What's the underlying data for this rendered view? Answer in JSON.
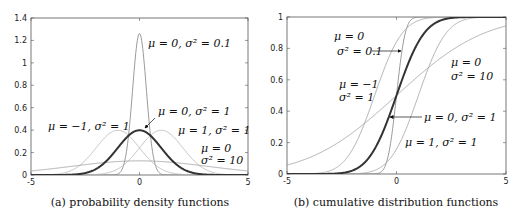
{
  "chart_data": [
    {
      "type": "line",
      "title": "(a) probability density functions",
      "xlabel": "",
      "ylabel": "",
      "xlim": [
        -5,
        5
      ],
      "ylim": [
        0,
        1.4
      ],
      "xticks": [
        -5,
        0,
        5
      ],
      "yticks": [
        0,
        0.2,
        0.4,
        0.6,
        0.8,
        1,
        1.2,
        1.4
      ],
      "grid": false,
      "function": "pdf",
      "series": [
        {
          "name": "μ = 0, σ² = 0.1",
          "mu": 0,
          "var": 0.1,
          "color": "#808080",
          "width": 0.8,
          "peak": 1.26
        },
        {
          "name": "μ = −1, σ² = 1",
          "mu": -1,
          "var": 1,
          "color": "#b4b4b4",
          "width": 0.8,
          "peak": 0.4
        },
        {
          "name": "μ = 1, σ² = 1",
          "mu": 1,
          "var": 1,
          "color": "#b4b4b4",
          "width": 0.8,
          "peak": 0.4
        },
        {
          "name": "μ = 0, σ² = 10",
          "mu": 0,
          "var": 10,
          "color": "#9a9a9a",
          "width": 0.8,
          "peak": 0.126
        },
        {
          "name": "μ = 0, σ² = 1",
          "mu": 0,
          "var": 1,
          "color": "#333333",
          "width": 2,
          "peak": 0.4
        }
      ],
      "annotations": [
        {
          "text": "μ = 0, σ² = 0.1",
          "x": 148,
          "y": 47
        },
        {
          "text": "μ = −1, σ² = 1",
          "x": 48,
          "y": 130
        },
        {
          "text": "μ = 0, σ² = 1",
          "x": 158,
          "y": 115
        },
        {
          "text": "μ = 1, σ² = 1",
          "x": 178,
          "y": 134
        },
        {
          "text": "μ = 0",
          "x": 201,
          "y": 152
        },
        {
          "text": "σ² = 10",
          "x": 201,
          "y": 164
        }
      ]
    },
    {
      "type": "line",
      "title": "(b) cumulative distribution functions",
      "xlabel": "",
      "ylabel": "",
      "xlim": [
        -5,
        5
      ],
      "ylim": [
        0,
        1
      ],
      "xticks": [
        -5,
        0,
        5
      ],
      "yticks": [
        0,
        0.2,
        0.4,
        0.6,
        0.8,
        1
      ],
      "grid": false,
      "function": "cdf",
      "series": [
        {
          "name": "μ = 0, σ² = 0.1",
          "mu": 0,
          "var": 0.1,
          "color": "#808080",
          "width": 0.8
        },
        {
          "name": "μ = −1, σ² = 1",
          "mu": -1,
          "var": 1,
          "color": "#a0a0a0",
          "width": 0.8
        },
        {
          "name": "μ = 1, σ² = 1",
          "mu": 1,
          "var": 1,
          "color": "#a0a0a0",
          "width": 0.8
        },
        {
          "name": "μ = 0, σ² = 10",
          "mu": 0,
          "var": 10,
          "color": "#9a9a9a",
          "width": 0.8
        },
        {
          "name": "μ = 0, σ² = 1",
          "mu": 0,
          "var": 1,
          "color": "#333333",
          "width": 2
        }
      ],
      "annotations": [
        {
          "text": "μ = 0",
          "x": 334,
          "y": 40
        },
        {
          "text": "σ² = 0.1",
          "x": 337,
          "y": 55
        },
        {
          "text": "μ = −1",
          "x": 339,
          "y": 88
        },
        {
          "text": "σ² = 1",
          "x": 339,
          "y": 101
        },
        {
          "text": "μ = 0",
          "x": 451,
          "y": 66
        },
        {
          "text": "σ² = 10",
          "x": 451,
          "y": 80
        },
        {
          "text": "μ = 0, σ² = 1",
          "x": 424,
          "y": 121
        },
        {
          "text": "μ = 1, σ² = 1",
          "x": 405,
          "y": 146
        }
      ]
    }
  ]
}
